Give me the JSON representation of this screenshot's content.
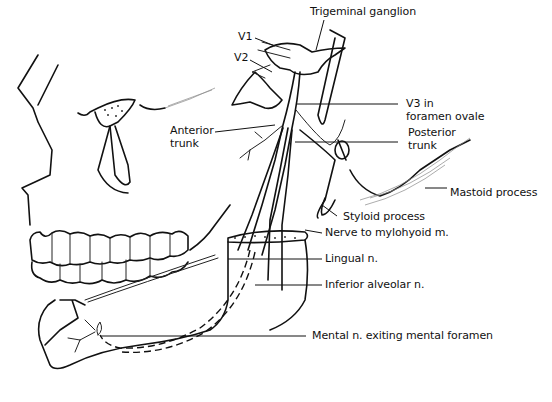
{
  "diagram": {
    "labels": {
      "trigeminal_ganglion": "Trigeminal ganglion",
      "v1": "V1",
      "v2": "V2",
      "v3_line1": "V3 in",
      "v3_line2": "foramen ovale",
      "anterior_trunk_line1": "Anterior",
      "anterior_trunk_line2": "trunk",
      "posterior_trunk_line1": "Posterior",
      "posterior_trunk_line2": "trunk",
      "mastoid_process": "Mastoid process",
      "styloid_process": "Styloid process",
      "nerve_to_mylohyoid": "Nerve to mylohyoid m.",
      "lingual_n": "Lingual n.",
      "inferior_alveolar_n": "Inferior alveolar n.",
      "mental_n": "Mental n. exiting mental foramen"
    },
    "colors": {
      "ink": "#111111",
      "background": "#ffffff"
    }
  }
}
